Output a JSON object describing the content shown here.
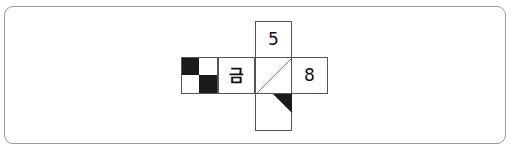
{
  "diagram": {
    "type": "cube-net",
    "faces": {
      "top": {
        "label": "5"
      },
      "left_outer": {
        "label": "",
        "pattern": "checkerboard-2x2",
        "filled_cells": [
          "top-left",
          "bottom-right"
        ]
      },
      "left": {
        "label": "금"
      },
      "center": {
        "label": "",
        "pattern": "diagonal-line",
        "direction": "bottom-left to top-right"
      },
      "right": {
        "label": "8"
      },
      "bottom": {
        "label": "",
        "pattern": "black-triangle",
        "corner": "top-right"
      }
    },
    "colors": {
      "border": "#555555",
      "fill": "#1a1a1a",
      "frame": "#9a9a9a"
    }
  }
}
